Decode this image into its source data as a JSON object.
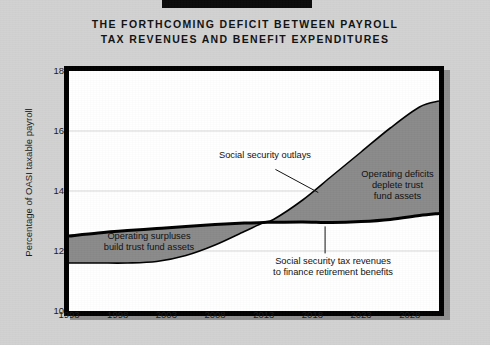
{
  "title": {
    "line1": "THE FORTHCOMING DEFICIT BETWEEN PAYROLL",
    "line2": "TAX REVENUES AND BENEFIT EXPENDITURES"
  },
  "chart_data": {
    "type": "area",
    "title": "THE FORTHCOMING DEFICIT BETWEEN PAYROLL TAX REVENUES AND BENEFIT EXPENDITURES",
    "xlabel": "",
    "ylabel": "Percentage of OASI taxable payroll",
    "xlim": [
      1993,
      2031
    ],
    "ylim": [
      10,
      18
    ],
    "yticks": [
      10,
      12,
      14,
      16,
      18
    ],
    "xticks": [
      1993,
      1998,
      2003,
      2008,
      2013,
      2018,
      2023,
      2028
    ],
    "grid": "horizontal",
    "legend": "none",
    "fill_between_color": "#8a8a8a",
    "line_color": "#000000",
    "x": [
      1993,
      1996,
      1999,
      2002,
      2005,
      2008,
      2011,
      2013,
      2014,
      2017,
      2020,
      2023,
      2026,
      2029,
      2031
    ],
    "series": [
      {
        "name": "Social security outlays",
        "values": [
          11.6,
          11.6,
          11.6,
          11.65,
          11.85,
          12.2,
          12.65,
          12.95,
          13.05,
          13.7,
          14.5,
          15.3,
          16.1,
          16.8,
          17.0
        ]
      },
      {
        "name": "Social security tax revenues",
        "values": [
          12.5,
          12.6,
          12.68,
          12.75,
          12.82,
          12.88,
          12.93,
          12.95,
          12.96,
          12.97,
          12.95,
          12.98,
          13.05,
          13.18,
          13.25
        ]
      }
    ],
    "annotations": [
      {
        "name": "operating-surpluses",
        "text": "Operating surpluses build trust fund assets",
        "x": 2000,
        "y": 12.1
      },
      {
        "name": "operating-deficits",
        "text": "Operating deficits deplete trust fund assets",
        "x": 2026,
        "y": 14.4
      },
      {
        "name": "social-security-outlays",
        "text": "Social security outlays",
        "x": 2011,
        "y": 14.9
      },
      {
        "name": "social-security-tax-revenues",
        "text": "Social security tax revenues to finance retirement benefits",
        "x": 2020,
        "y": 11.5
      }
    ]
  },
  "axes": {
    "y_title": "Percentage of OASI taxable payroll",
    "y_ticks": [
      "18",
      "16",
      "14",
      "12",
      "10"
    ],
    "x_ticks": [
      "1993",
      "1998",
      "2003",
      "2008",
      "2013",
      "2018",
      "2023",
      "2028"
    ]
  },
  "annotations": {
    "surplus_line1": "Operating surpluses",
    "surplus_line2": "build trust fund assets",
    "deficit_line1": "Operating deficits",
    "deficit_line2": "deplete trust",
    "deficit_line3": "fund assets",
    "outlays": "Social security outlays",
    "revenues_line1": "Social security tax revenues",
    "revenues_line2": "to finance retirement benefits"
  },
  "colors": {
    "background": "#d2d2d2",
    "frame": "#000000",
    "plot_background": "#ffffff",
    "band_fill": "#8a8a8a",
    "shadow": "#8f8f8f"
  }
}
